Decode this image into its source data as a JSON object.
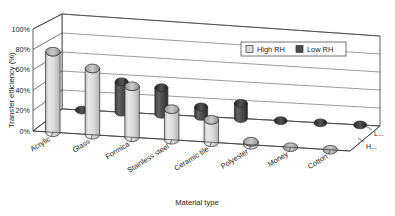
{
  "chart_data": {
    "type": "bar",
    "title": "",
    "xlabel": "Material type",
    "ylabel": "Transfer efficiency (%)",
    "ylim": [
      0,
      100
    ],
    "yticks": [
      "0%",
      "20%",
      "40%",
      "60%",
      "80%",
      "100%"
    ],
    "ytick_values": [
      0,
      20,
      40,
      60,
      80,
      100
    ],
    "grid": false,
    "legend_position": "top-right",
    "projection": "3d-cylinder",
    "categories": [
      "Acrylic",
      "Glass",
      "Formica",
      "Stainless steel",
      "Ceramic tile",
      "Polyester",
      "Money",
      "Cotton"
    ],
    "series": [
      {
        "name": "High RH",
        "color": "#d9d9d9",
        "row": "front",
        "edge_label": "H...",
        "values": [
          79,
          65,
          50,
          30,
          22,
          3,
          0,
          0
        ]
      },
      {
        "name": "Low RH",
        "color": "#4a4a4a",
        "row": "back",
        "edge_label": "L...",
        "values": [
          0,
          32,
          28,
          10,
          16,
          0,
          0,
          0
        ]
      }
    ]
  },
  "legend": {
    "items": [
      {
        "label": "High RH",
        "swatch": "#d9d9d9"
      },
      {
        "label": "Low RH",
        "swatch": "#4a4a4a"
      }
    ]
  },
  "axes": {
    "y_title": "Transfer efficiency (%)",
    "x_title": "Material type",
    "y_ticks": [
      "100%",
      "80%",
      "60%",
      "40%",
      "20%",
      "0%"
    ],
    "x_categories": [
      "Acrylic",
      "Glass",
      "Formica",
      "Stainless steel",
      "Ceramic tile",
      "Polyester",
      "Money",
      "Cotton"
    ],
    "depth_labels": [
      "L...",
      "H..."
    ]
  },
  "colors": {
    "high_rh": "#d9d9d9",
    "low_rh": "#4a4a4a",
    "outline": "#3a3a3a",
    "background": "#ffffff"
  }
}
